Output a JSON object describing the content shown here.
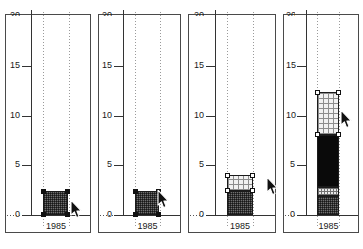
{
  "figure": {
    "title": "",
    "panel_count": 4
  },
  "axis": {
    "y_ticks": [
      "20",
      "15",
      "10",
      "5",
      "0"
    ],
    "y_tick_values": [
      20,
      15,
      10,
      5,
      0
    ],
    "y_min": 0,
    "y_max": 20,
    "x_categories": [
      "1985"
    ],
    "x_label": "",
    "y_label": ""
  },
  "chart_data": {
    "type": "bar",
    "title": "",
    "xlabel": "",
    "ylabel": "",
    "ylim": [
      0,
      20
    ],
    "categories": [
      "1985"
    ],
    "grid": "dotted-vertical",
    "legend": "none",
    "panels": [
      {
        "index": 1,
        "name": "panel-1",
        "caption": "",
        "segments": [
          {
            "label": "segment-1",
            "from": 0,
            "to": 2.4,
            "value": 2.4,
            "fill": "dark-gray-dither",
            "selected": true
          }
        ],
        "total": 2.4,
        "cursor": {
          "x_frac": 0.74,
          "y_value": 1.1,
          "state": "arrow"
        }
      },
      {
        "index": 2,
        "name": "panel-2",
        "caption": "",
        "segments": [
          {
            "label": "segment-1",
            "from": 0,
            "to": 2.4,
            "value": 2.4,
            "fill": "dark-gray-dither",
            "selected": true
          }
        ],
        "total": 2.4,
        "cursor": {
          "x_frac": 0.7,
          "y_value": 2.1,
          "state": "arrow"
        }
      },
      {
        "index": 3,
        "name": "panel-3",
        "caption": "",
        "segments": [
          {
            "label": "segment-1",
            "from": 0,
            "to": 2.4,
            "value": 2.4,
            "fill": "dark-gray-dither",
            "selected": false
          },
          {
            "label": "segment-2",
            "from": 2.4,
            "to": 4.0,
            "value": 1.6,
            "fill": "light-grid",
            "selected": true
          }
        ],
        "total": 4.0,
        "cursor": {
          "x_frac": 0.88,
          "y_value": 3.4,
          "state": "arrow"
        }
      },
      {
        "index": 4,
        "name": "panel-4",
        "caption": "",
        "segments": [
          {
            "label": "segment-1",
            "from": 0,
            "to": 1.9,
            "value": 1.9,
            "fill": "dark-gray-dither",
            "selected": false
          },
          {
            "label": "segment-2",
            "from": 1.9,
            "to": 2.8,
            "value": 0.9,
            "fill": "dense-grid",
            "selected": false
          },
          {
            "label": "segment-3",
            "from": 2.8,
            "to": 8.1,
            "value": 5.3,
            "fill": "black",
            "selected": false
          },
          {
            "label": "segment-4",
            "from": 8.1,
            "to": 12.4,
            "value": 4.3,
            "fill": "light-grid",
            "selected": true
          }
        ],
        "total": 12.4,
        "cursor": {
          "x_frac": 0.74,
          "y_value": 10.2,
          "state": "arrow"
        }
      }
    ]
  },
  "colors": {
    "frame": "#4a4a4a",
    "axis": "#333333",
    "gridline": "#9a9a9a",
    "text": "#1a1a1a",
    "fill_dark_gray": "#6e6e6e",
    "fill_black": "#0a0a0a",
    "fill_light_grid": "#f2f2f2",
    "fill_dense_grid": "#e9e9e9",
    "handle_solid": "#111111",
    "handle_hollow": "#ffffff",
    "background": "#ffffff"
  }
}
